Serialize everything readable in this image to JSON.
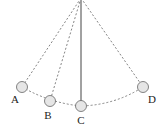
{
  "diagram": {
    "type": "pendulum-swing",
    "pivot": {
      "x": 81,
      "y": -2
    },
    "colors": {
      "line": "#444444",
      "dashed": "#666666",
      "ball_fill": "#e6e6e6",
      "ball_stroke": "#666666",
      "label": "#222222"
    },
    "positions": [
      {
        "id": "A",
        "label": "A",
        "ball": {
          "x": 22,
          "y": 87
        },
        "label_pos": {
          "x": 15,
          "y": 102
        },
        "string": "dashed"
      },
      {
        "id": "B",
        "label": "B",
        "ball": {
          "x": 50,
          "y": 101
        },
        "label_pos": {
          "x": 48,
          "y": 118
        },
        "string": "dashed"
      },
      {
        "id": "C",
        "label": "C",
        "ball": {
          "x": 81,
          "y": 106
        },
        "label_pos": {
          "x": 81,
          "y": 123
        },
        "string": "solid"
      },
      {
        "id": "D",
        "label": "D",
        "ball": {
          "x": 143,
          "y": 87
        },
        "label_pos": {
          "x": 151,
          "y": 102
        },
        "string": "dashed"
      }
    ]
  }
}
